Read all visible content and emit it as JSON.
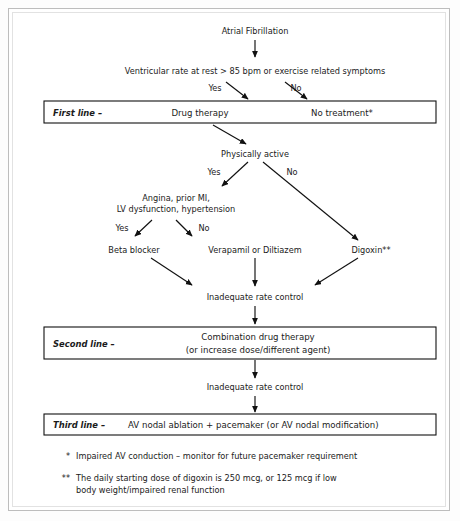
{
  "document": {
    "title": "Atrial Fibrillation rate control treatment algorithm",
    "kind": "clinical-flowchart"
  },
  "nodes": {
    "start": "Atrial Fibrillation",
    "criteria": "Ventricular rate at rest > 85 bpm or exercise related symptoms",
    "physically_active": "Physically active",
    "comorbidity_line1": "Angina, prior MI,",
    "comorbidity_line2": "LV dysfunction, hypertension",
    "beta_blocker": "Beta blocker",
    "verapamil": "Verapamil or Diltiazem",
    "digoxin": "Digoxin**",
    "inadequate_1": "Inadequate rate control",
    "inadequate_2": "Inadequate rate control"
  },
  "branches": {
    "criteria_yes": "Yes",
    "criteria_no": "No",
    "active_yes": "Yes",
    "active_no": "No",
    "comorbid_yes": "Yes",
    "comorbid_no": "No"
  },
  "boxes": {
    "first_line": {
      "label": "First line –",
      "option_left": "Drug therapy",
      "option_right": "No treatment*"
    },
    "second_line": {
      "label": "Second line –",
      "body_line1": "Combination drug therapy",
      "body_line2": "(or increase dose/different agent)"
    },
    "third_line": {
      "label": "Third line –",
      "body": "AV nodal ablation + pacemaker (or AV nodal modification)"
    }
  },
  "footnotes": [
    {
      "marker": "*",
      "text": "Impaired AV conduction – monitor for future pacemaker requirement"
    },
    {
      "marker": "**",
      "line1": "The daily starting dose of digoxin is 250 mcg, or 125 mcg if low",
      "line2": "body weight/impaired renal function"
    }
  ],
  "colors": {
    "ink": "#111111",
    "box_border": "#111111",
    "frame_outer": "#bdbdbd",
    "frame_inner": "#e2e2e2",
    "page_background": "#ffffff"
  }
}
